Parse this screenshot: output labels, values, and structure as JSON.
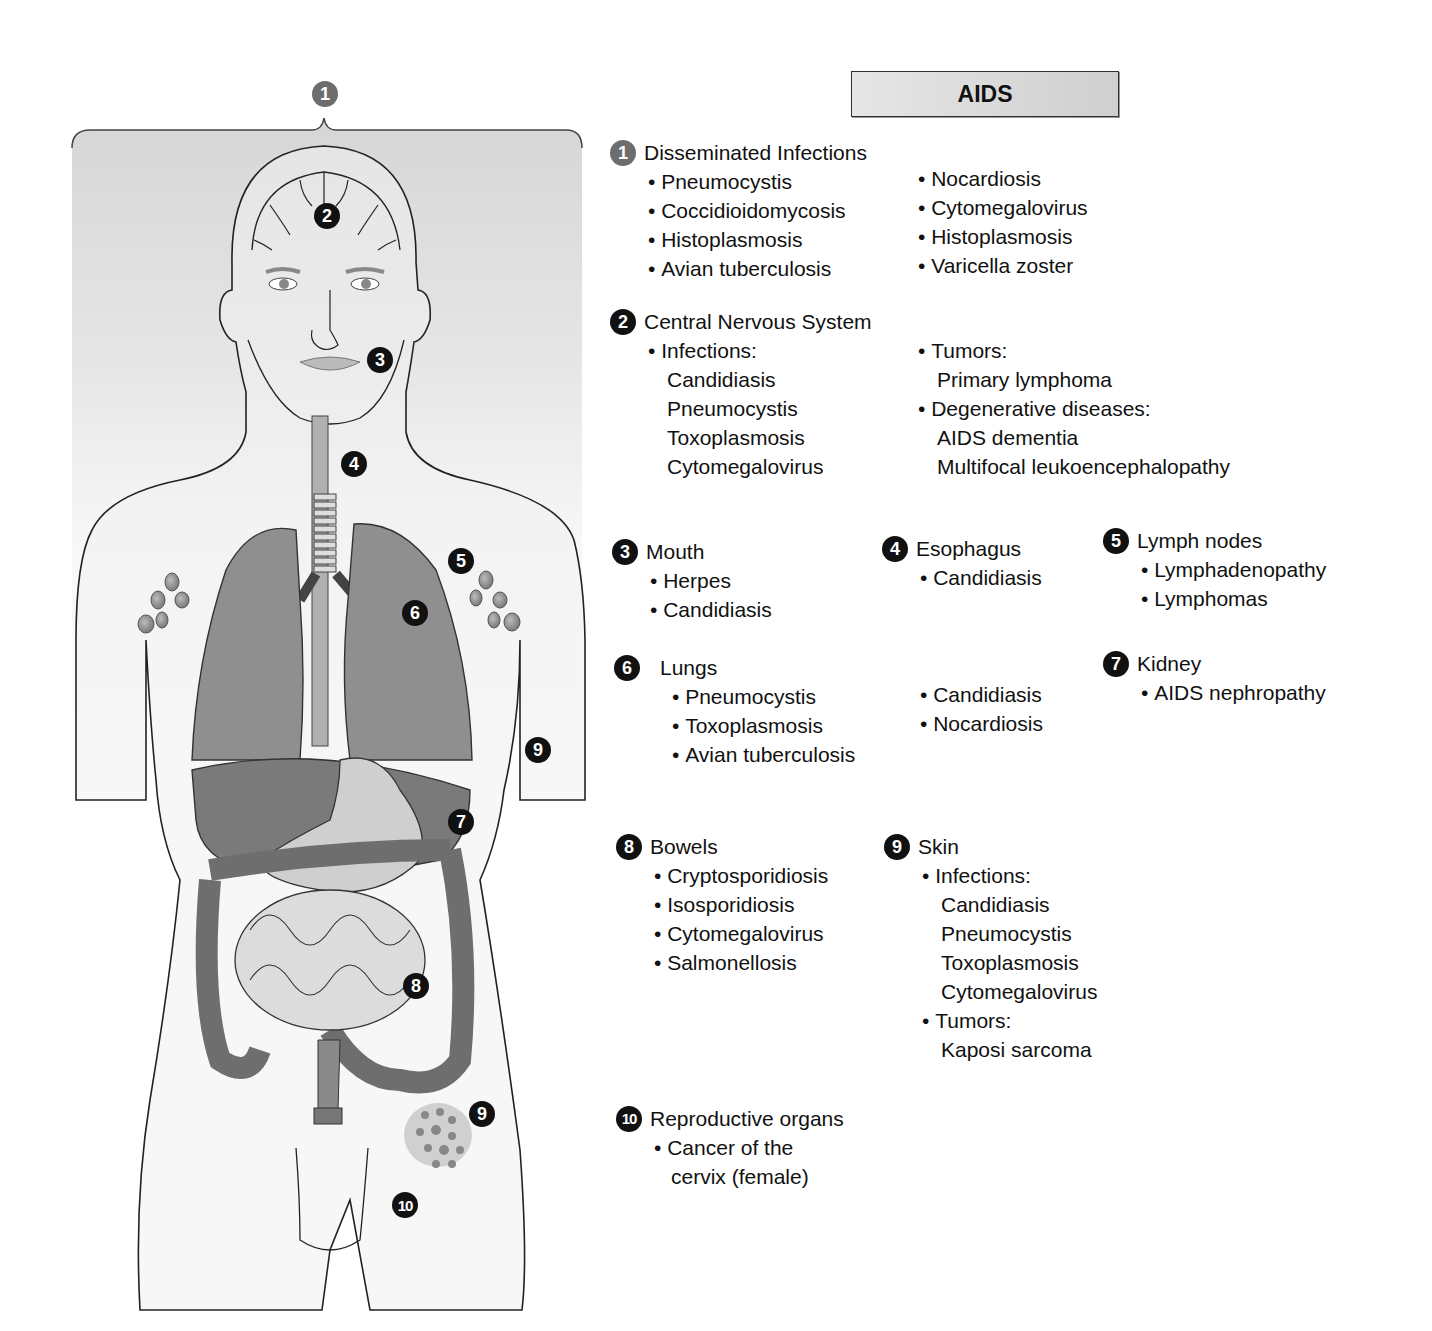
{
  "title": "AIDS",
  "figure": {
    "markers": [
      {
        "num": "1",
        "x": 312,
        "y": 81,
        "style": "gray"
      },
      {
        "num": "2",
        "x": 314,
        "y": 203,
        "style": "dark"
      },
      {
        "num": "3",
        "x": 367,
        "y": 347,
        "style": "dark"
      },
      {
        "num": "4",
        "x": 341,
        "y": 451,
        "style": "dark"
      },
      {
        "num": "5",
        "x": 448,
        "y": 548,
        "style": "dark"
      },
      {
        "num": "6",
        "x": 402,
        "y": 600,
        "style": "dark"
      },
      {
        "num": "9",
        "x": 525,
        "y": 737,
        "style": "dark"
      },
      {
        "num": "7",
        "x": 448,
        "y": 809,
        "style": "dark"
      },
      {
        "num": "8",
        "x": 403,
        "y": 973,
        "style": "dark"
      },
      {
        "num": "9",
        "x": 469,
        "y": 1101,
        "style": "dark"
      },
      {
        "num": "10",
        "x": 392,
        "y": 1192,
        "style": "dark"
      }
    ]
  },
  "sections": {
    "s1": {
      "num": "1",
      "heading": "Disseminated Infections",
      "col1": [
        "Pneumocystis",
        "Coccidioidomycosis",
        "Histoplasmosis",
        "Avian tuberculosis"
      ],
      "col2": [
        "Nocardiosis",
        "Cytomegalovirus",
        "Histoplasmosis",
        "Varicella zoster"
      ]
    },
    "s2": {
      "num": "2",
      "heading": "Central Nervous System",
      "col1_head": "Infections:",
      "col1": [
        "Candidiasis",
        "Pneumocystis",
        "Toxoplasmosis",
        "Cytomegalovirus"
      ],
      "col2_head1": "Tumors:",
      "col2_items1": [
        "Primary lymphoma"
      ],
      "col2_head2": "Degenerative diseases:",
      "col2_items2": [
        "AIDS dementia",
        "Multifocal leukoencephalopathy"
      ]
    },
    "s3": {
      "num": "3",
      "heading": "Mouth",
      "items": [
        "Herpes",
        "Candidiasis"
      ]
    },
    "s4": {
      "num": "4",
      "heading": "Esophagus",
      "items": [
        "Candidiasis"
      ]
    },
    "s5": {
      "num": "5",
      "heading": "Lymph nodes",
      "items": [
        "Lymphadenopathy",
        "Lymphomas"
      ]
    },
    "s6": {
      "num": "6",
      "heading": "Lungs",
      "col1": [
        "Pneumocystis",
        "Toxoplasmosis",
        "Avian tuberculosis"
      ],
      "col2": [
        "Candidiasis",
        "Nocardiosis"
      ]
    },
    "s7": {
      "num": "7",
      "heading": "Kidney",
      "items": [
        "AIDS nephropathy"
      ]
    },
    "s8": {
      "num": "8",
      "heading": "Bowels",
      "items": [
        "Cryptosporidiosis",
        "Isosporidiosis",
        "Cytomegalovirus",
        "Salmonellosis"
      ]
    },
    "s9": {
      "num": "9",
      "heading": "Skin",
      "head1": "Infections:",
      "items1": [
        "Candidiasis",
        "Pneumocystis",
        "Toxoplasmosis",
        "Cytomegalovirus"
      ],
      "head2": "Tumors:",
      "items2": [
        "Kaposi sarcoma"
      ]
    },
    "s10": {
      "num": "10",
      "heading": "Reproductive organs",
      "items": [
        "Cancer of the",
        "cervix (female)"
      ]
    }
  },
  "colors": {
    "marker_dark": "#111111",
    "marker_gray": "#6d6d6d",
    "title_bg": "#d9d9d9"
  }
}
